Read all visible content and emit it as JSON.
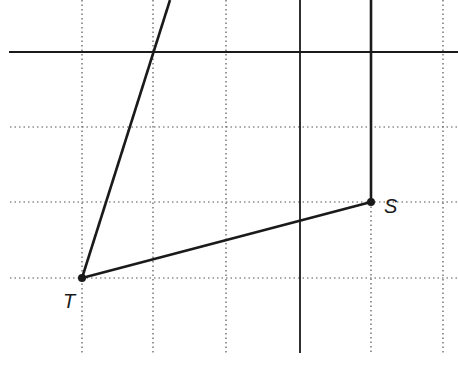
{
  "diagram": {
    "type": "grid-geometry",
    "colors": {
      "background": "#ffffff",
      "grid": "#555555",
      "line": "#1a1a1a"
    },
    "grid": {
      "vertical_x": [
        82,
        153,
        226,
        443
      ],
      "horizontal_y": [
        127,
        202,
        278
      ],
      "x_range": [
        10,
        458
      ],
      "y_range": [
        0,
        353
      ]
    },
    "solid_lines": {
      "horizontal_axis": {
        "x1": 9,
        "y1": 52,
        "x2": 458,
        "y2": 52
      },
      "vertical_axis": {
        "x1": 300,
        "y1": 0,
        "x2": 300,
        "y2": 353
      }
    },
    "points": [
      {
        "name": "T",
        "label": "T",
        "x": 82,
        "y": 278
      },
      {
        "name": "S",
        "label": "S",
        "x": 371,
        "y": 202
      }
    ],
    "segments": [
      {
        "from": "T",
        "to_x": 170,
        "to_y": 0
      },
      {
        "from": "T",
        "to": "S"
      },
      {
        "from": "S",
        "to_x": 371,
        "to_y": 0
      }
    ]
  }
}
